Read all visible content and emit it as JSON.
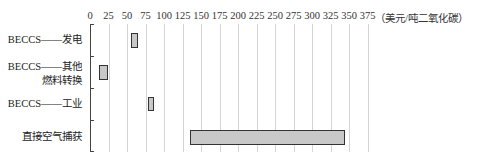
{
  "chart_data": {
    "type": "bar",
    "orientation": "horizontal",
    "subtype": "floating-range",
    "title": "",
    "xlabel": "（美元/吨二氧化碳）",
    "ylabel": "",
    "xlim": [
      0,
      375
    ],
    "x_ticks": [
      "0",
      "25",
      "50",
      "75",
      "100",
      "125",
      "150",
      "175",
      "200",
      "225",
      "250",
      "275",
      "300",
      "325",
      "350",
      "375"
    ],
    "grid": true,
    "legend": null,
    "categories": [
      "BECCS——发电",
      "BECCS——其他燃料转换",
      "BECCS——工业",
      "直接空气捕获"
    ],
    "series": [
      {
        "name": "cost range",
        "low": [
          55,
          12,
          78,
          135
        ],
        "high": [
          65,
          24,
          85,
          345
        ]
      }
    ],
    "bar_color": "#c8c8c8",
    "bar_edge_color": "#333333"
  },
  "labels": {
    "unit": "（美元/吨二氧化碳）",
    "cat0_line1": "BECCS——发电",
    "cat1_line1": "BECCS——其他",
    "cat1_line2": "燃料转换",
    "cat2_line1": "BECCS——工业",
    "cat3_line1": "直接空气捕获"
  }
}
